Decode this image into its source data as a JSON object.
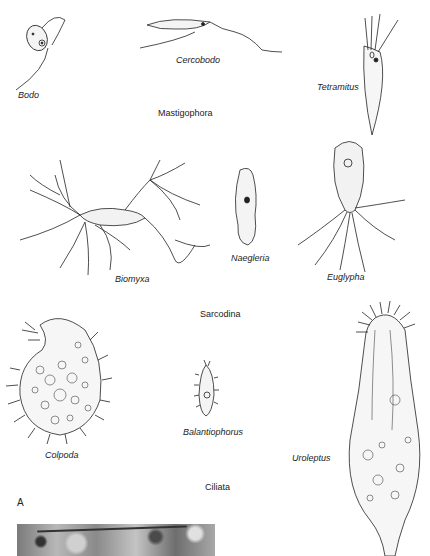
{
  "figure": {
    "panel_label": "A",
    "groups": [
      {
        "name": "Mastigophora",
        "organisms": [
          "Bodo",
          "Cercobodo",
          "Tetramitus"
        ]
      },
      {
        "name": "Sarcodina",
        "organisms": [
          "Biomyxa",
          "Naegleria",
          "Euglypha"
        ]
      },
      {
        "name": "Ciliata",
        "organisms": [
          "Colpoda",
          "Balantiophorus",
          "Uroleptus"
        ]
      }
    ],
    "photo": {
      "description": "micrograph"
    }
  }
}
